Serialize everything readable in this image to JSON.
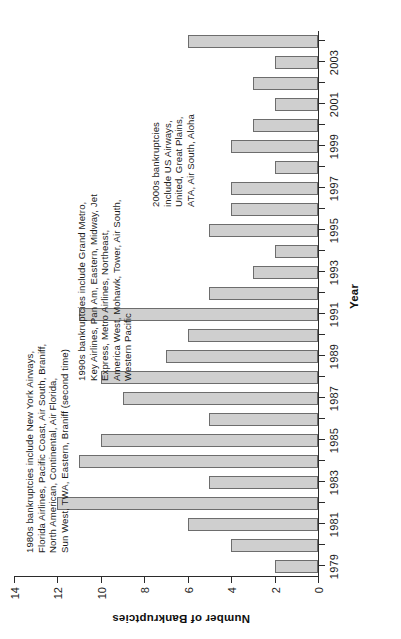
{
  "chart_data": {
    "type": "bar",
    "title": "",
    "xlabel": "Year",
    "ylabel": "Number of Bankruptcies",
    "orientation": "vertical-bars-rotated-page",
    "grid": false,
    "legend": "none",
    "ylim": [
      0,
      14
    ],
    "ytick_values": [
      0,
      2,
      4,
      6,
      8,
      10,
      12,
      14
    ],
    "ytick_labels": [
      "0",
      "2",
      "4",
      "6",
      "8",
      "10",
      "12",
      "14"
    ],
    "categories": [
      "1979",
      "1980",
      "1981",
      "1982",
      "1983",
      "1984",
      "1985",
      "1986",
      "1987",
      "1988",
      "1989",
      "1990",
      "1991",
      "1992",
      "1993",
      "1994",
      "1995",
      "1996",
      "1997",
      "1998",
      "1999",
      "2000",
      "2001",
      "2002",
      "2003",
      "2004"
    ],
    "xtick_labels_shown": [
      "1979",
      "1981",
      "1983",
      "1985",
      "1987",
      "1989",
      "1991",
      "1993",
      "1995",
      "1997",
      "1999",
      "2001",
      "2003"
    ],
    "values": [
      2,
      4,
      6,
      12,
      5,
      11,
      10,
      5,
      9,
      10,
      7,
      6,
      11,
      5,
      3,
      2,
      5,
      4,
      4,
      2,
      4,
      3,
      2,
      3,
      2,
      6
    ],
    "bar_fill_color": "#cfcfcf",
    "bar_edge_color": "#6d6d6d",
    "annotations": [
      {
        "id": "1980s",
        "text": "1980s bankruptcies include New York Airways,\nFlorida Airlines, Pacific Coast, Air South, Braniff,\nNorth American, Continental, Air Florida,\nSun West, TWA, Eastern, Braniff (second time)"
      },
      {
        "id": "1990s",
        "text": "1990s bankruptcies include Grand Metro,\nKey Airlines, Pan Am, Eastern, Midway, Jet\nExpress, Metro Airlines, Northeast,\nAmerica West, Mohawk, Tower, Air South,\nWestern Pacific"
      },
      {
        "id": "2000s",
        "text": "2000s bankruptcies\ninclude US Airways,\nUnited, Great Plains,\nATA, Air South, Aloha"
      }
    ]
  }
}
